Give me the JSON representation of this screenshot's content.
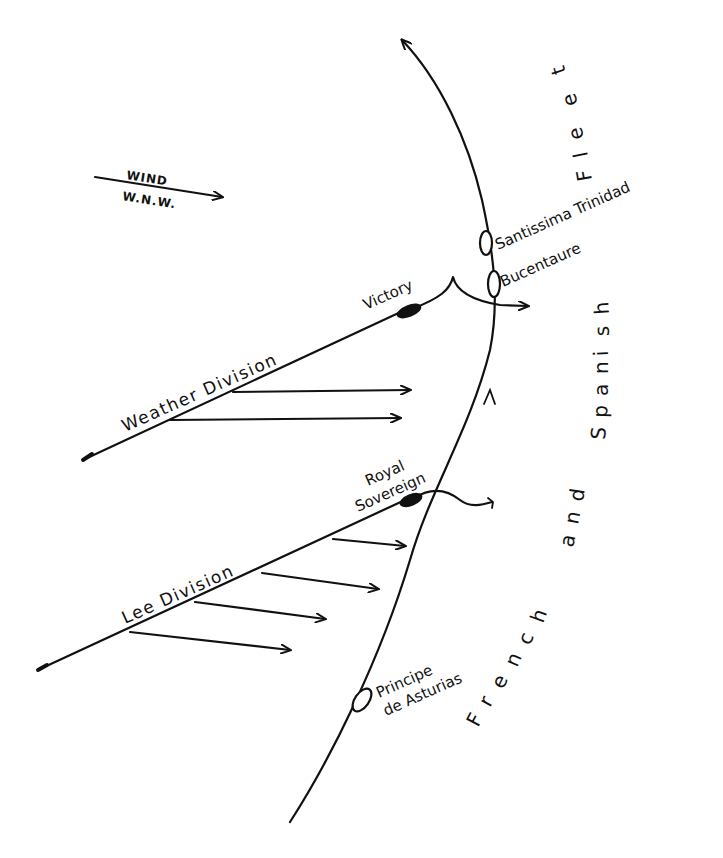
{
  "diagram": {
    "title_area": {
      "wind": {
        "label": "WIND",
        "direction": "W.N.W."
      }
    },
    "british": {
      "weather_division": {
        "label": "Weather Division",
        "flagship": "Victory"
      },
      "lee_division": {
        "label": "Lee Division",
        "flagship_line1": "Royal",
        "flagship_line2": "Sovereign"
      }
    },
    "enemy": {
      "fleet_label_letters": [
        "F",
        "r",
        "e",
        "n",
        "c",
        "h",
        "a",
        "n",
        "d",
        "S",
        "p",
        "a",
        "n",
        "i",
        "s",
        "h",
        "F",
        "l",
        "e",
        "e",
        "t"
      ],
      "fleet_label": "French and Spanish Fleet",
      "ships": {
        "santissima": "Santissima Trinidad",
        "bucentaure": "Bucentaure",
        "principe_line1": "Principe",
        "principe_line2": "de Asturias"
      }
    },
    "colors": {
      "ink": "#111111",
      "paper": "#ffffff"
    }
  }
}
